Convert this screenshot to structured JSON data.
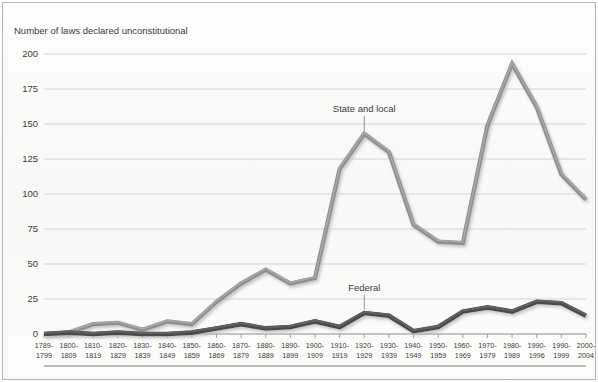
{
  "chart_data": {
    "type": "line",
    "title": "",
    "ylabel": "Number of laws declared unconstitutional",
    "xlabel": "",
    "ylim": [
      0,
      200
    ],
    "yticks": [
      0,
      25,
      50,
      75,
      100,
      125,
      150,
      175,
      200
    ],
    "ytick_labels": [
      "0",
      "25",
      "50",
      "75",
      "100",
      "125",
      "150",
      "175",
      "200"
    ],
    "grid": true,
    "legend_position": "inline-annotations",
    "categories": [
      "1789-1799",
      "1800-1809",
      "1810-1819",
      "1820-1829",
      "1830-1839",
      "1840-1849",
      "1850-1859",
      "1860-1869",
      "1870-1879",
      "1880-1889",
      "1890-1899",
      "1900-1909",
      "1910-1919",
      "1920-1929",
      "1930-1939",
      "1940-1949",
      "1950-1959",
      "1960-1969",
      "1970-1979",
      "1980-1989",
      "1990-1996",
      "1990-1999",
      "2000-2004"
    ],
    "category_lines": [
      [
        "1789-",
        "1799"
      ],
      [
        "1800-",
        "1809"
      ],
      [
        "1810-",
        "1819"
      ],
      [
        "1820-",
        "1829"
      ],
      [
        "1830-",
        "1839"
      ],
      [
        "1840-",
        "1849"
      ],
      [
        "1850-",
        "1859"
      ],
      [
        "1860-",
        "1869"
      ],
      [
        "1870-",
        "1879"
      ],
      [
        "1880-",
        "1889"
      ],
      [
        "1890-",
        "1899"
      ],
      [
        "1900-",
        "1909"
      ],
      [
        "1910-",
        "1919"
      ],
      [
        "1920-",
        "1929"
      ],
      [
        "1930-",
        "1939"
      ],
      [
        "1940-",
        "1949"
      ],
      [
        "1950-",
        "1959"
      ],
      [
        "1960-",
        "1969"
      ],
      [
        "1970-",
        "1979"
      ],
      [
        "1980-",
        "1989"
      ],
      [
        "1990-",
        "1996"
      ],
      [
        "1990-",
        "1999"
      ],
      [
        "2000-",
        "2004"
      ]
    ],
    "series": [
      {
        "name": "State and local",
        "color": "#8e8e8e",
        "values": [
          0,
          1,
          7,
          8,
          3,
          9,
          7,
          23,
          36,
          46,
          36,
          40,
          118,
          143,
          130,
          78,
          66,
          65,
          149,
          193,
          162,
          114,
          96
        ]
      },
      {
        "name": "Federal",
        "color": "#4a4a4a",
        "values": [
          0,
          1,
          0,
          1,
          0,
          0,
          1,
          4,
          7,
          4,
          5,
          9,
          5,
          15,
          13,
          2,
          5,
          16,
          19,
          16,
          23,
          22,
          13
        ]
      }
    ],
    "annotations": [
      {
        "text": "State and local",
        "category_index": 13,
        "value": 143
      },
      {
        "text": "Federal",
        "category_index": 13,
        "value": 15
      }
    ]
  },
  "colors": {
    "state_local_line": "#8e8e8e",
    "state_local_highlight": "#a8a8a8",
    "federal_line": "#4a4a4a",
    "federal_highlight": "#606060",
    "gridline": "#c9c9c9",
    "axis": "#6e6e6e",
    "text": "#3b3b3b",
    "background": "#fdfdfc",
    "frame": "#b5b5b5",
    "shadow": "#c4c4c4"
  }
}
